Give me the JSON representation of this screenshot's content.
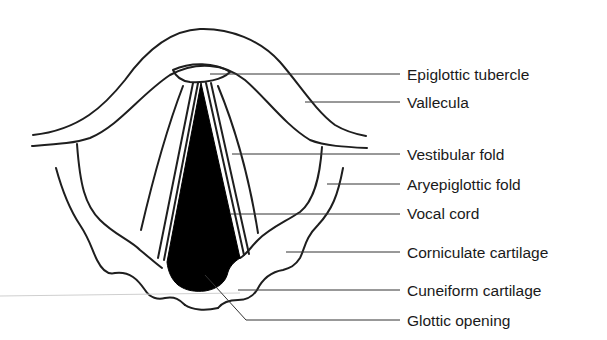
{
  "diagram": {
    "type": "anatomical-illustration",
    "labels": [
      {
        "id": "epiglottic-tubercle",
        "text": "Epiglottic tubercle"
      },
      {
        "id": "vallecula",
        "text": "Vallecula"
      },
      {
        "id": "vestibular-fold",
        "text": "Vestibular fold"
      },
      {
        "id": "aryepiglottic-fold",
        "text": "Aryepiglottic fold"
      },
      {
        "id": "vocal-cord",
        "text": "Vocal cord"
      },
      {
        "id": "corniculate-cartilage",
        "text": "Corniculate cartilage"
      },
      {
        "id": "cuneiform-cartilage",
        "text": "Cuneiform cartilage"
      },
      {
        "id": "glottic-opening",
        "text": "Glottic opening"
      }
    ],
    "colors": {
      "background": "#ffffff",
      "outline": "#1e1e1e",
      "glottis_fill": "#000000"
    }
  }
}
